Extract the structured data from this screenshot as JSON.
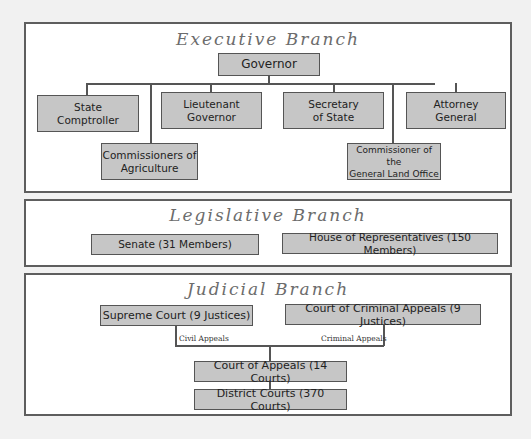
{
  "executive": {
    "title": "Executive Branch",
    "governor": "Governor",
    "state_comptroller": [
      "State",
      "Comptroller"
    ],
    "lieutenant_governor": [
      "Lieutenant",
      "Governor"
    ],
    "secretary_of_state": [
      "Secretary",
      "of State"
    ],
    "attorney_general": [
      "Attorney",
      "General"
    ],
    "commissioners_agriculture": [
      "Commissioners of",
      "Agriculture"
    ],
    "commissioner_land_office": [
      "Commissioner of the",
      "General Land Office"
    ]
  },
  "legislative": {
    "title": "Legislative Branch",
    "senate": "Senate (31 Members)",
    "house": "House of Representatives (150 Members)"
  },
  "judicial": {
    "title": "Judicial Branch",
    "supreme_court": "Supreme Court (9 Justices)",
    "criminal_appeals_court": "Court of Criminal Appeals (9 Justices)",
    "civil_appeals_label": "Civil Appeals",
    "criminal_appeals_label": "Criminal Appeals",
    "court_of_appeals": "Court of Appeals (14 Courts)",
    "district_courts": "District Courts (370 Courts)"
  },
  "colors": {
    "page_background": "#f1f1f1",
    "panel_background": "#ffffff",
    "panel_border": "#5e5e5e",
    "box_fill": "#c6c6c6",
    "box_border": "#555555",
    "title_text": "#6c6c6c",
    "box_text": "#222222"
  }
}
